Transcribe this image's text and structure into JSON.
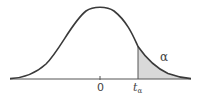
{
  "diagram": {
    "title": "",
    "curve": "standard normal / t-distribution density",
    "labels": {
      "center": "0",
      "critical_value_base": "t",
      "critical_value_sub": "α",
      "tail_area": "α"
    },
    "colors": {
      "curve": "#3a3a3a",
      "axis": "#555555",
      "shade": "#d9d9d9",
      "background": "#ffffff"
    }
  }
}
